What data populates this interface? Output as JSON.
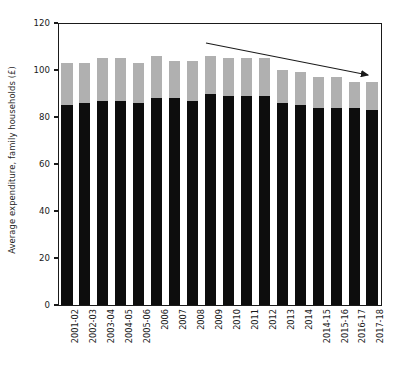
{
  "chart_data": {
    "type": "bar",
    "subtype": "stacked",
    "title": "",
    "xlabel": "",
    "ylabel": "Average expenditure, family households (£)",
    "ylim": [
      0,
      120
    ],
    "yticks": [
      0,
      20,
      40,
      60,
      80,
      100,
      120
    ],
    "ytick_labels": [
      "0",
      "20",
      "40",
      "60",
      "80",
      "100",
      "120"
    ],
    "grid": false,
    "legend": "none",
    "categories": [
      "2001-02",
      "2002-03",
      "2003-04",
      "2004-05",
      "2005-06",
      "2006",
      "2007",
      "2008",
      "2009",
      "2010",
      "2011",
      "2012",
      "2013",
      "2014",
      "2014-15",
      "2015-16",
      "2016-17",
      "2017-18"
    ],
    "series": [
      {
        "name": "lower-segment",
        "color": "#0d0d0d",
        "values": [
          85,
          86,
          87,
          87,
          86,
          88,
          88,
          87,
          90,
          89,
          89,
          89,
          86,
          85,
          84,
          84,
          84,
          83
        ]
      },
      {
        "name": "upper-segment",
        "color": "#b0b0b0",
        "values": [
          18,
          17,
          18,
          18,
          17,
          18,
          16,
          17,
          16,
          16,
          16,
          16,
          14,
          14,
          13,
          13,
          11,
          12
        ]
      }
    ],
    "totals": [
      103,
      103,
      105,
      105,
      103,
      106,
      104,
      104,
      106,
      105,
      105,
      105,
      100,
      99,
      97,
      97,
      95,
      95
    ],
    "annotations": [
      {
        "type": "arrow",
        "label": "declining-trend-arrow",
        "from": [
          206,
          43
        ],
        "to": [
          372,
          76
        ],
        "color": "#1a1a1a"
      }
    ]
  },
  "axis": {
    "y_title": "Average expenditure, family households (£)"
  }
}
